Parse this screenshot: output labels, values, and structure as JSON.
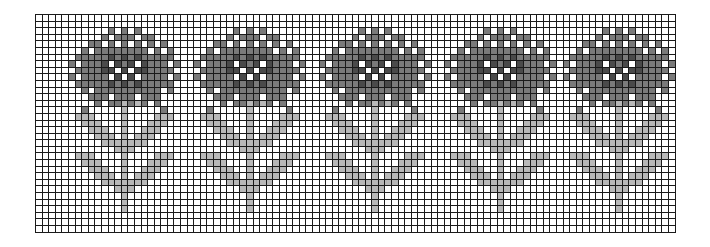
{
  "chart_grid": {
    "columns": 97,
    "rows": 33,
    "cell_px": 6.6,
    "line_color": "#1a1a1a",
    "palette": {
      "0": "#ffffff",
      "1": "#b8b8b8",
      "2": "#7a7a7a",
      "3": "#4a4a4a"
    },
    "legend": {
      "0": "background (white)",
      "1": "stem & leaves (light gray)",
      "2": "flower petals (mid gray)",
      "3": "flower center (dark gray)"
    }
  },
  "motif": {
    "name": "flower",
    "width": 19,
    "origin_row": 1,
    "rows": [
      "0000000000000000000",
      "0000000202020000000",
      "0000002022202200000",
      "0000220202020202000",
      "0002022222222020200",
      "0022222323232222200",
      "0202223032303222020",
      "0022223303033222200",
      "0202222030302222020",
      "0022222323232222200",
      "0002022222222220200",
      "0000222022202220000",
      "0000020221212020000",
      "0002000001000002000",
      "0011100001000011100",
      "0001110001000111000",
      "0000111001001110000",
      "0000011101011100000",
      "0000001111111000000",
      "0000000011100000000",
      "0011100001000011100",
      "0001110001000111000",
      "0000111001001110000",
      "0000011101011100000",
      "0000001111111000000",
      "0000000011100000000",
      "0000000001000000000",
      "0000000001000000000",
      "0000000001000000000"
    ]
  },
  "motif_centers_col": [
    13,
    32,
    51,
    70,
    88
  ]
}
